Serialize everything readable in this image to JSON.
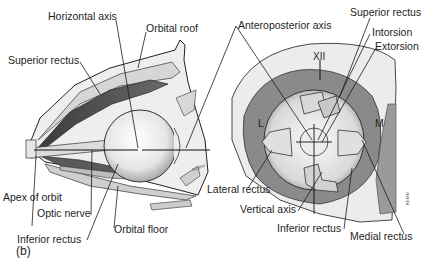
{
  "figure": {
    "panel_label": "(b)",
    "left_view": {
      "title": "Lateral (sagittal) view of orbit",
      "labels": {
        "horizontal_axis": "Horizontal axis",
        "orbital_roof": "Orbital roof",
        "superior_rectus": "Superior rectus",
        "apex_of_orbit": "Apex of orbit",
        "optic_nerve": "Optic nerve",
        "inferior_rectus": "Inferior rectus",
        "orbital_floor": "Orbital floor"
      },
      "signature": "REMM"
    },
    "right_view": {
      "title": "Frontal view of eye",
      "labels": {
        "anteroposterior_axis": "Anteroposterior axis",
        "superior_rectus": "Superior rectus",
        "intorsion": "Intorsion",
        "extorsion": "Extorsion",
        "xii": "XII",
        "lateral_side": "L",
        "medial_side": "M",
        "lateral_rectus": "Lateral rectus",
        "vertical_axis": "Vertical axis",
        "inferior_rectus": "Inferior rectus",
        "medial_rectus": "Medial rectus"
      },
      "signature": "REMM"
    }
  },
  "colors": {
    "line": "#1a1a1a",
    "dark_muscle": "#4a4a4a",
    "mid_gray": "#8c8c8c",
    "light_gray": "#c8c8c8",
    "bone": "#e9e9e9",
    "globe": "#f4f4f4"
  }
}
